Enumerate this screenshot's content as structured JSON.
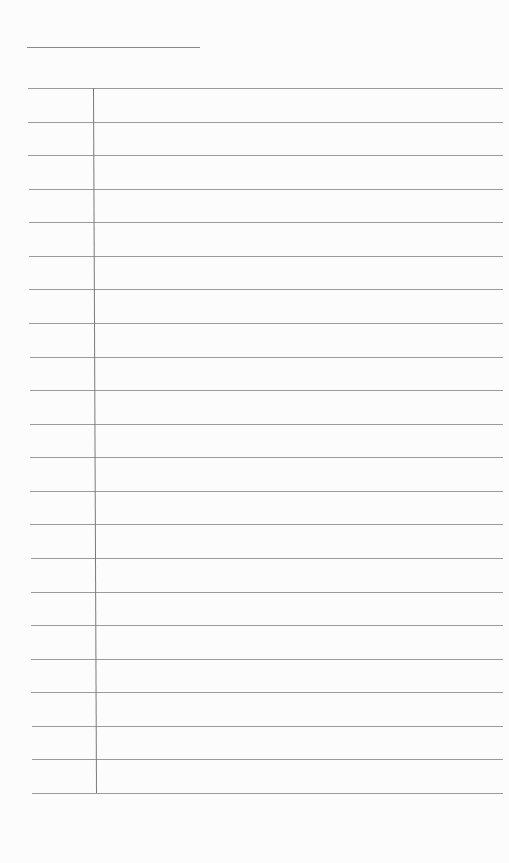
{
  "document": {
    "type": "blank lined form",
    "title_line": {
      "x1": 27,
      "x2": 200,
      "y": 47
    },
    "table": {
      "top": 88,
      "bottom": 793,
      "left": 28,
      "right": 503,
      "divider_x_top": 93,
      "divider_x_bottom": 96,
      "row_count": 21,
      "line_color": "#8a8a8a"
    },
    "cells": []
  }
}
